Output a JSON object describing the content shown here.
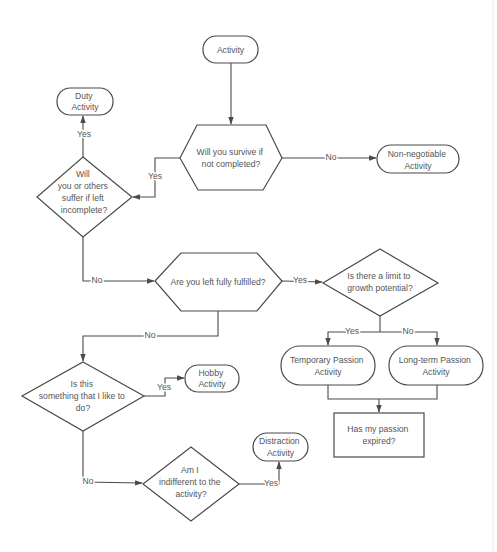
{
  "diagram": {
    "type": "flowchart",
    "nodes": {
      "activity": {
        "shape": "terminator",
        "lines": [
          "Activity"
        ]
      },
      "survive": {
        "shape": "hexagon",
        "lines": [
          "Will you survive if",
          "not completed?"
        ]
      },
      "non_negotiable": {
        "shape": "terminator",
        "lines": [
          "Non-negotiable",
          "Activity"
        ]
      },
      "suffer": {
        "shape": "decision",
        "lines": [
          "Will",
          "you or others",
          "suffer if left",
          "incomplete?"
        ]
      },
      "duty": {
        "shape": "terminator",
        "lines": [
          "Duty",
          "Activity"
        ]
      },
      "fulfilled": {
        "shape": "hexagon",
        "lines": [
          "Are you left fully fulfilled?"
        ]
      },
      "limit": {
        "shape": "decision",
        "lines": [
          "Is there a limit to",
          "growth potential?"
        ]
      },
      "temporary": {
        "shape": "terminator",
        "lines": [
          "Temporary Passion",
          "Activity"
        ]
      },
      "longterm": {
        "shape": "terminator",
        "lines": [
          "Long-term Passion",
          "Activity"
        ]
      },
      "expired": {
        "shape": "process",
        "lines": [
          "Has my passion",
          "expired?"
        ]
      },
      "like": {
        "shape": "decision",
        "lines": [
          "Is this",
          "something that I like to",
          "do?"
        ]
      },
      "hobby": {
        "shape": "terminator",
        "lines": [
          "Hobby",
          "Activity"
        ]
      },
      "indifferent": {
        "shape": "decision",
        "lines": [
          "Am I",
          "indifferent to the",
          "activity?"
        ]
      },
      "distraction": {
        "shape": "terminator",
        "lines": [
          "Distraction",
          "Activity"
        ]
      }
    },
    "edges": {
      "activity_survive": {
        "from": "activity",
        "to": "survive",
        "label": ""
      },
      "survive_non_negotiable": {
        "from": "survive",
        "to": "non_negotiable",
        "label": "No"
      },
      "survive_suffer": {
        "from": "survive",
        "to": "suffer",
        "label": "Yes"
      },
      "suffer_duty": {
        "from": "suffer",
        "to": "duty",
        "label": "Yes"
      },
      "suffer_fulfilled": {
        "from": "suffer",
        "to": "fulfilled",
        "label": "No"
      },
      "fulfilled_limit": {
        "from": "fulfilled",
        "to": "limit",
        "label": "Yes"
      },
      "fulfilled_like": {
        "from": "fulfilled",
        "to": "like",
        "label": "No"
      },
      "limit_temporary": {
        "from": "limit",
        "to": "temporary",
        "label": "Yes"
      },
      "limit_longterm": {
        "from": "limit",
        "to": "longterm",
        "label": "No"
      },
      "passion_expired": {
        "from": "temporary+longterm",
        "to": "expired",
        "label": ""
      },
      "like_hobby": {
        "from": "like",
        "to": "hobby",
        "label": "Yes"
      },
      "like_indifferent": {
        "from": "like",
        "to": "indifferent",
        "label": "No"
      },
      "indifferent_distraction": {
        "from": "indifferent",
        "to": "distraction",
        "label": "Yes"
      }
    },
    "colors": {
      "line": "#4a4a4a",
      "text": "#555555",
      "background": "#ffffff"
    }
  }
}
